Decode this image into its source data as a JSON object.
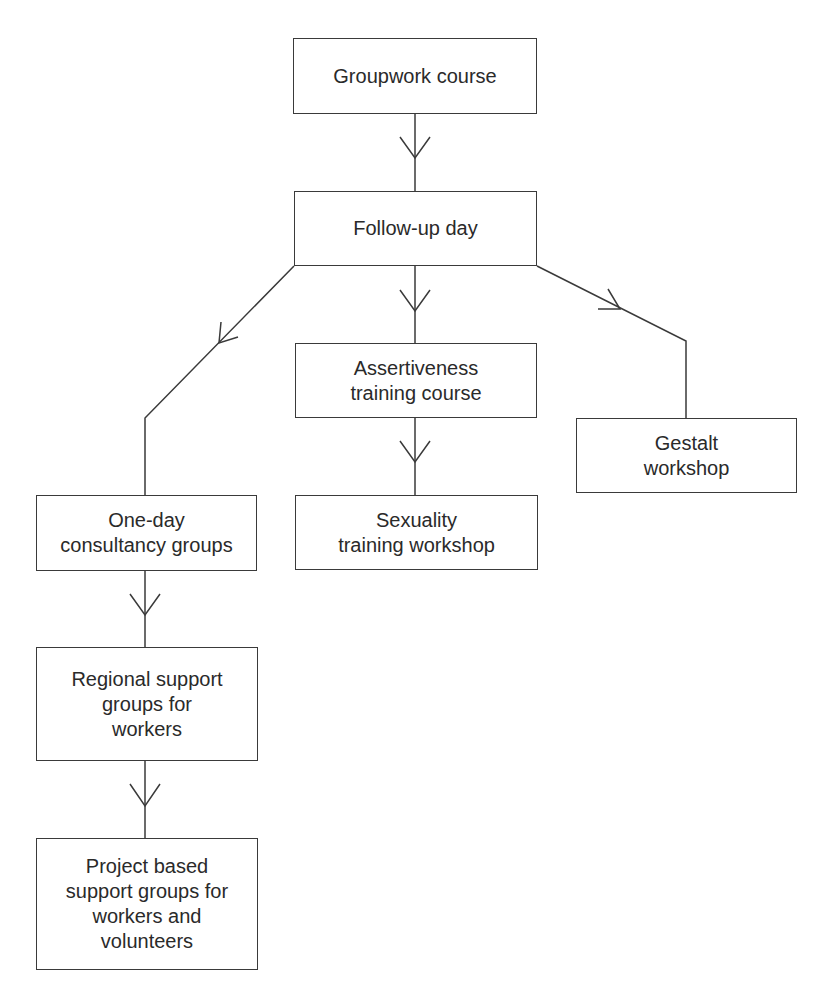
{
  "diagram": {
    "type": "flowchart",
    "colors": {
      "line": "#3a3a3a",
      "text": "#2a2a2a",
      "background": "#ffffff"
    },
    "nodes": [
      {
        "id": "groupwork",
        "label": "Groupwork course"
      },
      {
        "id": "followup",
        "label": "Follow-up day"
      },
      {
        "id": "assertiveness",
        "label": "Assertiveness\ntraining course"
      },
      {
        "id": "sexuality",
        "label": "Sexuality\ntraining workshop"
      },
      {
        "id": "gestalt",
        "label": "Gestalt\nworkshop"
      },
      {
        "id": "oneday",
        "label": "One-day\nconsultancy groups"
      },
      {
        "id": "regional",
        "label": "Regional support\ngroups for\nworkers"
      },
      {
        "id": "project",
        "label": "Project based\nsupport groups for\nworkers and\nvolunteers"
      }
    ],
    "edges": [
      {
        "from": "groupwork",
        "to": "followup"
      },
      {
        "from": "followup",
        "to": "assertiveness"
      },
      {
        "from": "followup",
        "to": "oneday"
      },
      {
        "from": "followup",
        "to": "gestalt"
      },
      {
        "from": "assertiveness",
        "to": "sexuality"
      },
      {
        "from": "oneday",
        "to": "regional"
      },
      {
        "from": "regional",
        "to": "project"
      }
    ]
  }
}
